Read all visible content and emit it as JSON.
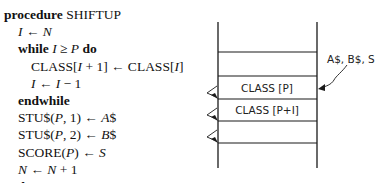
{
  "code": {
    "lines": [
      {
        "indent": 0,
        "parts": [
          {
            "t": "procedure",
            "s": "kw"
          },
          {
            "t": " SHIFTUP",
            "s": ""
          }
        ]
      },
      {
        "indent": 1,
        "parts": [
          {
            "t": "I",
            "s": "it"
          },
          {
            "t": " ← ",
            "s": ""
          },
          {
            "t": "N",
            "s": "it"
          }
        ]
      },
      {
        "indent": 1,
        "parts": [
          {
            "t": "while ",
            "s": "kw"
          },
          {
            "t": "I",
            "s": "it"
          },
          {
            "t": " ≥ ",
            "s": ""
          },
          {
            "t": "P",
            "s": "it"
          },
          {
            "t": " do",
            "s": "kw"
          }
        ]
      },
      {
        "indent": 2,
        "parts": [
          {
            "t": "CLASS[",
            "s": ""
          },
          {
            "t": "I",
            "s": "it"
          },
          {
            "t": " + 1] ← CLASS[",
            "s": ""
          },
          {
            "t": "I",
            "s": "it"
          },
          {
            "t": "]",
            "s": ""
          }
        ]
      },
      {
        "indent": 2,
        "parts": [
          {
            "t": "I",
            "s": "it"
          },
          {
            "t": " ← ",
            "s": ""
          },
          {
            "t": "I",
            "s": "it"
          },
          {
            "t": " − 1",
            "s": ""
          }
        ]
      },
      {
        "indent": 1,
        "parts": [
          {
            "t": "endwhile",
            "s": "kw"
          }
        ]
      },
      {
        "indent": 1,
        "parts": [
          {
            "t": "STU$(",
            "s": ""
          },
          {
            "t": "P",
            "s": "it"
          },
          {
            "t": ", 1) ← ",
            "s": ""
          },
          {
            "t": "A",
            "s": "it"
          },
          {
            "t": "$",
            "s": ""
          }
        ]
      },
      {
        "indent": 1,
        "parts": [
          {
            "t": "STU$(",
            "s": ""
          },
          {
            "t": "P",
            "s": "it"
          },
          {
            "t": ", 2) ← ",
            "s": ""
          },
          {
            "t": "B",
            "s": "it"
          },
          {
            "t": "$",
            "s": ""
          }
        ]
      },
      {
        "indent": 1,
        "parts": [
          {
            "t": "SCORE(",
            "s": ""
          },
          {
            "t": "P",
            "s": "it"
          },
          {
            "t": ") ← ",
            "s": ""
          },
          {
            "t": "S",
            "s": "it"
          }
        ]
      },
      {
        "indent": 1,
        "parts": [
          {
            "t": "N",
            "s": "it"
          },
          {
            "t": " ← ",
            "s": ""
          },
          {
            "t": "N",
            "s": "it"
          },
          {
            "t": " + 1",
            "s": ""
          }
        ]
      },
      {
        "indent": 0,
        "parts": [
          {
            "t": "endproc",
            "s": "kw"
          }
        ]
      }
    ]
  },
  "diagram": {
    "cells": [
      {
        "label": ""
      },
      {
        "label": ""
      },
      {
        "label": "CLASS [P]"
      },
      {
        "label": "CLASS [P+I]"
      },
      {
        "label": ""
      },
      {
        "label": ""
      }
    ],
    "insert_label": "A$, B$, S",
    "shift_arrows": 3,
    "line_color": "#1a1a1a"
  }
}
